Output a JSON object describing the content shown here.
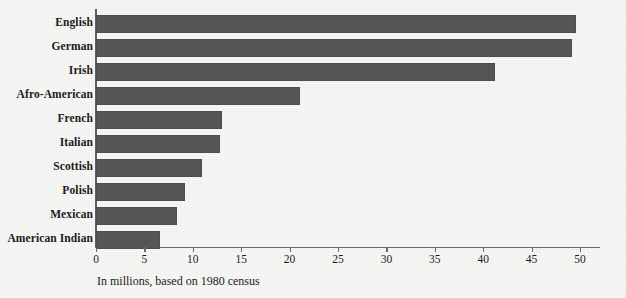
{
  "chart_data": {
    "type": "bar",
    "orientation": "horizontal",
    "title": "",
    "subtitle": "",
    "xlabel": "In millions, based on 1980 census",
    "ylabel": "",
    "xlim": [
      0,
      50
    ],
    "xticks": [
      0,
      5,
      10,
      15,
      20,
      25,
      30,
      35,
      40,
      45,
      50
    ],
    "xtick_labels": [
      "0",
      "5",
      "10",
      "15",
      "20",
      "25",
      "30",
      "35",
      "40",
      "45",
      "50"
    ],
    "grid": false,
    "legend": null,
    "categories": [
      "English",
      "German",
      "Irish",
      "Afro-American",
      "French",
      "Italian",
      "Scottish",
      "Polish",
      "Mexican",
      "American Indian"
    ],
    "values": [
      49.6,
      49.2,
      41.2,
      21.1,
      13.0,
      12.8,
      11.0,
      9.2,
      8.4,
      6.6
    ],
    "units": "millions",
    "bar_color": "#565656",
    "axis_color": "#6a6a6a",
    "background_color": "#f5f5f4",
    "text_color": "#1b1b1b"
  },
  "caption": {
    "text": "In millions, based on 1980 census"
  }
}
